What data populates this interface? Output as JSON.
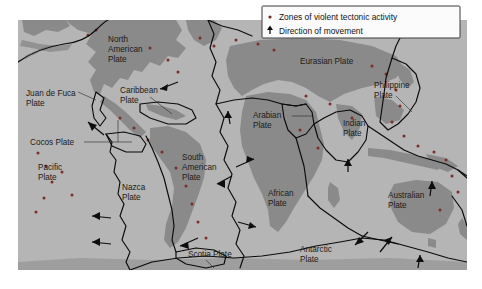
{
  "figure": {
    "name": "world-tectonic-plates-map",
    "page_background": "#ffffff"
  },
  "map": {
    "frame": {
      "x": 18,
      "y": 20,
      "width": 449,
      "height": 250
    },
    "colors": {
      "ocean": "#b5b5b5",
      "land": "#8a8a8a",
      "land_dark": "#7e7e7e",
      "boundary": "#0a0a0a",
      "volcanic_zone": "#7d2b28",
      "label_text": "#1a1a1a",
      "legend_background": "#fbfbfb",
      "legend_border": "#3d3d3d"
    },
    "arc_annotation": "Aleutian arc"
  },
  "legend": {
    "name": "map-legend",
    "box": {
      "x": 262,
      "y": 6,
      "width": 198,
      "height": 32
    },
    "items": [
      {
        "marker": "dot-marker",
        "label": "Zones of violent tectonic activity"
      },
      {
        "marker": "arrow-marker",
        "label": "Direction of movement"
      }
    ]
  },
  "plate_labels": [
    {
      "name": "north-american-plate",
      "lines": [
        "North",
        "American",
        "Plate"
      ],
      "x": 108,
      "y": 42,
      "anchor": "start"
    },
    {
      "name": "juan-de-fuca-plate",
      "lines": [
        "Juan de Fuca",
        "Plate"
      ],
      "x": 26,
      "y": 96,
      "anchor": "start"
    },
    {
      "name": "cocos-plate",
      "lines": [
        "Cocos Plate"
      ],
      "x": 30,
      "y": 145,
      "anchor": "start"
    },
    {
      "name": "pacific-plate",
      "lines": [
        "Pacific",
        "Plate"
      ],
      "x": 38,
      "y": 170,
      "anchor": "start"
    },
    {
      "name": "caribbean-plate",
      "lines": [
        "Caribbean",
        "Plate"
      ],
      "x": 120,
      "y": 93,
      "anchor": "start"
    },
    {
      "name": "nazca-plate",
      "lines": [
        "Nazca",
        "Plate"
      ],
      "x": 122,
      "y": 190,
      "anchor": "start"
    },
    {
      "name": "south-american-plate",
      "lines": [
        "South",
        "American",
        "Plate"
      ],
      "x": 182,
      "y": 160,
      "anchor": "start"
    },
    {
      "name": "scotia-plate",
      "lines": [
        "Scotia Plate"
      ],
      "x": 188,
      "y": 257,
      "anchor": "start"
    },
    {
      "name": "eurasian-plate",
      "lines": [
        "Eurasian Plate"
      ],
      "x": 300,
      "y": 64,
      "anchor": "start"
    },
    {
      "name": "arabian-plate",
      "lines": [
        "Arabian",
        "Plate"
      ],
      "x": 253,
      "y": 118,
      "anchor": "start"
    },
    {
      "name": "african-plate",
      "lines": [
        "African",
        "Plate"
      ],
      "x": 268,
      "y": 196,
      "anchor": "start"
    },
    {
      "name": "antarctic-plate",
      "lines": [
        "Antarctic",
        "Plate"
      ],
      "x": 300,
      "y": 252,
      "anchor": "start"
    },
    {
      "name": "indian-plate",
      "lines": [
        "Indian",
        "Plate"
      ],
      "x": 343,
      "y": 126,
      "anchor": "start"
    },
    {
      "name": "philippine-plate",
      "lines": [
        "Philippine",
        "Plate"
      ],
      "x": 374,
      "y": 88,
      "anchor": "start"
    },
    {
      "name": "australian-plate",
      "lines": [
        "Australian",
        "Plate"
      ],
      "x": 388,
      "y": 198,
      "anchor": "start"
    }
  ],
  "movement_arrows": [
    {
      "name": "arrow-caribbean-east",
      "x1": 178,
      "y1": 82,
      "x2": 156,
      "y2": 91
    },
    {
      "name": "arrow-juan-de-fuca",
      "x1": 104,
      "y1": 135,
      "x2": 84,
      "y2": 119
    },
    {
      "name": "arrow-nazca-west",
      "x1": 111,
      "y1": 218,
      "x2": 88,
      "y2": 216
    },
    {
      "name": "arrow-pacific-west",
      "x1": 111,
      "y1": 244,
      "x2": 88,
      "y2": 242
    },
    {
      "name": "arrow-south-american-west",
      "x1": 232,
      "y1": 176,
      "x2": 213,
      "y2": 185
    },
    {
      "name": "arrow-african-northeast",
      "x1": 236,
      "y1": 167,
      "x2": 258,
      "y2": 158
    },
    {
      "name": "arrow-african-east",
      "x1": 238,
      "y1": 222,
      "x2": 260,
      "y2": 228
    },
    {
      "name": "arrow-scotia-west",
      "x1": 198,
      "y1": 238,
      "x2": 176,
      "y2": 247
    },
    {
      "name": "arrow-arabian-north",
      "x1": 230,
      "y1": 124,
      "x2": 228,
      "y2": 108
    },
    {
      "name": "arrow-indian-north",
      "x1": 348,
      "y1": 172,
      "x2": 348,
      "y2": 156
    },
    {
      "name": "arrow-antarctic-southwest",
      "x1": 368,
      "y1": 232,
      "x2": 352,
      "y2": 248
    },
    {
      "name": "arrow-antarctic-northeast",
      "x1": 380,
      "y1": 252,
      "x2": 394,
      "y2": 234
    },
    {
      "name": "arrow-australian-north",
      "x1": 430,
      "y1": 196,
      "x2": 432,
      "y2": 178
    },
    {
      "name": "arrow-australian-south-north",
      "x1": 418,
      "y1": 268,
      "x2": 420,
      "y2": 252
    }
  ],
  "volcanic_zone_points": [
    {
      "x": 38,
      "y": 153
    },
    {
      "x": 46,
      "y": 166
    },
    {
      "x": 52,
      "y": 182
    },
    {
      "x": 44,
      "y": 198
    },
    {
      "x": 36,
      "y": 212
    },
    {
      "x": 62,
      "y": 172
    },
    {
      "x": 72,
      "y": 195
    },
    {
      "x": 88,
      "y": 35
    },
    {
      "x": 96,
      "y": 30
    },
    {
      "x": 150,
      "y": 48
    },
    {
      "x": 168,
      "y": 60
    },
    {
      "x": 178,
      "y": 72
    },
    {
      "x": 200,
      "y": 38
    },
    {
      "x": 214,
      "y": 46
    },
    {
      "x": 236,
      "y": 40
    },
    {
      "x": 258,
      "y": 44
    },
    {
      "x": 274,
      "y": 50
    },
    {
      "x": 306,
      "y": 96
    },
    {
      "x": 330,
      "y": 104
    },
    {
      "x": 352,
      "y": 118
    },
    {
      "x": 372,
      "y": 66
    },
    {
      "x": 386,
      "y": 74
    },
    {
      "x": 396,
      "y": 90
    },
    {
      "x": 400,
      "y": 106
    },
    {
      "x": 392,
      "y": 122
    },
    {
      "x": 404,
      "y": 136
    },
    {
      "x": 418,
      "y": 146
    },
    {
      "x": 434,
      "y": 152
    },
    {
      "x": 446,
      "y": 160
    },
    {
      "x": 452,
      "y": 176
    },
    {
      "x": 458,
      "y": 192
    },
    {
      "x": 440,
      "y": 210
    },
    {
      "x": 120,
      "y": 118
    },
    {
      "x": 134,
      "y": 128
    },
    {
      "x": 148,
      "y": 140
    },
    {
      "x": 162,
      "y": 152
    },
    {
      "x": 176,
      "y": 168
    },
    {
      "x": 186,
      "y": 186
    },
    {
      "x": 192,
      "y": 204
    },
    {
      "x": 198,
      "y": 222
    },
    {
      "x": 206,
      "y": 238
    },
    {
      "x": 300,
      "y": 130
    },
    {
      "x": 318,
      "y": 148
    }
  ]
}
